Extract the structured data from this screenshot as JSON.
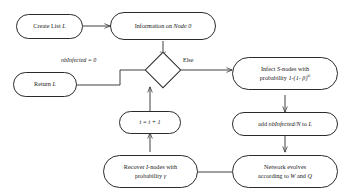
{
  "diagram": {
    "type": "flowchart",
    "stroke_color": "#2b2b2b",
    "background_color": "#ffffff",
    "nodes": [
      {
        "id": "create-list",
        "shape": "ellipse",
        "label": "Create List L",
        "label_plain": "Create List L"
      },
      {
        "id": "information-node",
        "shape": "ellipse",
        "label": "Information on Node 0",
        "label_plain": "Information on Node 0"
      },
      {
        "id": "decision",
        "shape": "diamond",
        "label": "",
        "label_plain": ""
      },
      {
        "id": "return-list",
        "shape": "ellipse",
        "label": "Return L",
        "label_plain": "Return L"
      },
      {
        "id": "infect-s-nodes",
        "shape": "ellipse",
        "label": "Infect S-nodes with probability 1-(1- β)^ki",
        "label_plain": "Infect S-nodes with probability 1-(1- β)^ki"
      },
      {
        "id": "add-to-list",
        "shape": "ellipse",
        "label": "add nbInfected/N to L",
        "label_plain": "add nbInfected/N to L"
      },
      {
        "id": "network-evolves",
        "shape": "ellipse",
        "label": "Network evolves according to W and Q",
        "label_plain": "Network evolves according to W and Q"
      },
      {
        "id": "recover-i-nodes",
        "shape": "ellipse",
        "label": "Recover I-nodes with probability γ",
        "label_plain": "Recover I-nodes with probability γ"
      },
      {
        "id": "increment-time",
        "shape": "ellipse",
        "label": "t = t + 1",
        "label_plain": "t = t + 1"
      }
    ],
    "node_text": {
      "create_list_prefix": "Create List ",
      "create_list_var": "L",
      "information_prefix": "Information on ",
      "information_var": "Node 0",
      "return_prefix": "Return ",
      "return_var": "L",
      "infect_line1_pre": "Infect ",
      "infect_line1_var": "S",
      "infect_line1_post": "-nodes with",
      "infect_line2_pre": "probability ",
      "infect_line2_formula": "1-(1- β)",
      "infect_line2_exponent": "ki",
      "add_pre": "add ",
      "add_var": "nbInfected/N",
      "add_mid": " to ",
      "add_var2": "L",
      "network_line1": "Network evolves",
      "network_line2_pre": "according to ",
      "network_line2_var1": "W",
      "network_line2_mid": " and ",
      "network_line2_var2": "Q",
      "recover_line1_pre": "Recover ",
      "recover_line1_var": "I",
      "recover_line1_post": "-nodes with",
      "recover_line2_pre": "probability ",
      "recover_line2_var": "γ",
      "increment_label": "t = t + 1"
    },
    "edge_labels": [
      {
        "id": "label-nbinfected-zero",
        "text": "nbInfected = 0",
        "italic": true
      },
      {
        "id": "label-else",
        "text": "Else",
        "italic": false
      }
    ],
    "edges": [
      {
        "from": "create-list",
        "to": "information-node",
        "label": ""
      },
      {
        "from": "information-node",
        "to": "decision",
        "label": ""
      },
      {
        "from": "decision",
        "to": "return-list",
        "label": "nbInfected = 0"
      },
      {
        "from": "decision",
        "to": "infect-s-nodes",
        "label": "Else"
      },
      {
        "from": "infect-s-nodes",
        "to": "add-to-list",
        "label": ""
      },
      {
        "from": "add-to-list",
        "to": "network-evolves",
        "label": ""
      },
      {
        "from": "network-evolves",
        "to": "recover-i-nodes",
        "label": ""
      },
      {
        "from": "recover-i-nodes",
        "to": "increment-time",
        "label": ""
      },
      {
        "from": "increment-time",
        "to": "decision",
        "label": ""
      }
    ]
  }
}
